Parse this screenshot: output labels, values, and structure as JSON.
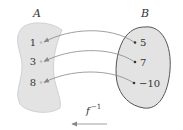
{
  "diagram": {
    "set_a": {
      "label": "A",
      "elements": [
        "1",
        "3",
        "8"
      ],
      "fill": "#e3e3e3",
      "stroke": "#c8c8c8"
    },
    "set_b": {
      "label": "B",
      "elements": [
        "5",
        "7",
        "−10"
      ],
      "fill": "#e3e3e3",
      "stroke": "#555555"
    },
    "mappings": [
      {
        "from": "5",
        "to": "1"
      },
      {
        "from": "7",
        "to": "3"
      },
      {
        "from": "−10",
        "to": "8"
      }
    ],
    "function": {
      "name": "f",
      "superscript": "−1",
      "direction": "left"
    },
    "arrow_color": "#888888"
  }
}
